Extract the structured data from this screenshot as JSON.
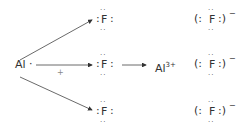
{
  "reactant_metal": "Al",
  "reactant_metal_dot": "·",
  "plus": "+",
  "fluorine": "F",
  "product_cation": "Al",
  "product_cation_charge": "3+",
  "anion_left": "(:",
  "anion_right": ":)",
  "anion_charge": "−",
  "colon": ":",
  "dot_pair": "··"
}
